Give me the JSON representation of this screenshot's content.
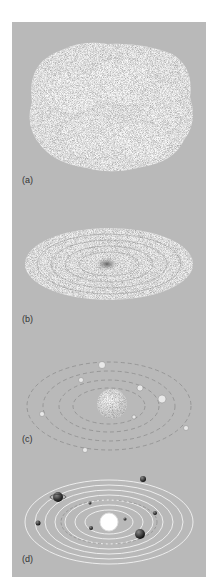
{
  "figure": {
    "background_color": "#b9b9b9",
    "panels": [
      {
        "id": "a",
        "label": "(a)",
        "description": "diffuse lumpy cloud"
      },
      {
        "id": "b",
        "label": "(b)",
        "description": "flattened rotating disk with dense center"
      },
      {
        "id": "c",
        "label": "(c)",
        "description": "central sphere with condensing planetesimals in rings"
      },
      {
        "id": "d",
        "label": "(d)",
        "description": "sun with planets in concentric orbits"
      }
    ]
  }
}
